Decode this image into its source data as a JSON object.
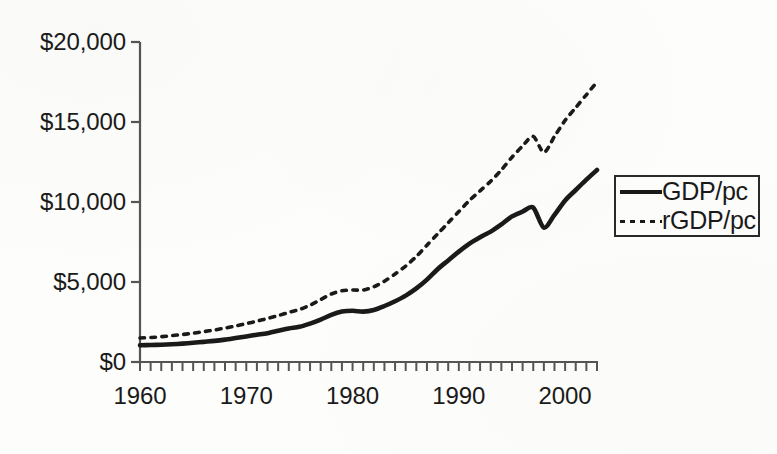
{
  "chart_data": {
    "type": "line",
    "title": "",
    "subtitle": "",
    "xlabel": "",
    "ylabel": "",
    "xlim": [
      1960,
      2003
    ],
    "ylim": [
      0,
      20000
    ],
    "grid": false,
    "legend_position": "right",
    "y_ticks": [
      0,
      5000,
      10000,
      15000,
      20000
    ],
    "y_tick_labels": [
      "$0",
      "$5,000",
      "$10,000",
      "$15,000",
      "$20,000"
    ],
    "x_ticks": [
      1960,
      1970,
      1980,
      1990,
      2000
    ],
    "x_tick_labels": [
      "1960",
      "1970",
      "1980",
      "1990",
      "2000"
    ],
    "x_minor_tick_interval": 1,
    "x": [
      1960,
      1961,
      1962,
      1963,
      1964,
      1965,
      1966,
      1967,
      1968,
      1969,
      1970,
      1971,
      1972,
      1973,
      1974,
      1975,
      1976,
      1977,
      1978,
      1979,
      1980,
      1981,
      1982,
      1983,
      1984,
      1985,
      1986,
      1987,
      1988,
      1989,
      1990,
      1991,
      1992,
      1993,
      1994,
      1995,
      1996,
      1997,
      1998,
      1999,
      2000,
      2001,
      2002,
      2003
    ],
    "series": [
      {
        "name": "GDP/pc",
        "style": "solid",
        "color": "#1a1a1a",
        "values": [
          1050,
          1060,
          1080,
          1110,
          1150,
          1200,
          1260,
          1320,
          1400,
          1500,
          1600,
          1700,
          1800,
          1950,
          2100,
          2200,
          2400,
          2650,
          2950,
          3150,
          3200,
          3150,
          3250,
          3500,
          3800,
          4150,
          4600,
          5150,
          5800,
          6350,
          6900,
          7400,
          7800,
          8150,
          8600,
          9100,
          9400,
          9650,
          8400,
          9200,
          10100,
          10750,
          11400,
          12000
        ]
      },
      {
        "name": "rGDP/pc",
        "style": "dotted",
        "color": "#1a1a1a",
        "values": [
          1500,
          1530,
          1580,
          1650,
          1720,
          1800,
          1900,
          2000,
          2120,
          2250,
          2400,
          2550,
          2720,
          2900,
          3100,
          3280,
          3550,
          3900,
          4250,
          4450,
          4500,
          4500,
          4700,
          5050,
          5500,
          6000,
          6600,
          7300,
          8000,
          8700,
          9400,
          10100,
          10700,
          11300,
          12000,
          12800,
          13500,
          14100,
          13100,
          14100,
          15100,
          15900,
          16700,
          17500
        ]
      }
    ]
  },
  "legend": {
    "entries": [
      {
        "label": "GDP/pc",
        "swatch": "solid-line-swatch"
      },
      {
        "label": "rGDP/pc",
        "swatch": "dotted-line-swatch"
      }
    ]
  }
}
